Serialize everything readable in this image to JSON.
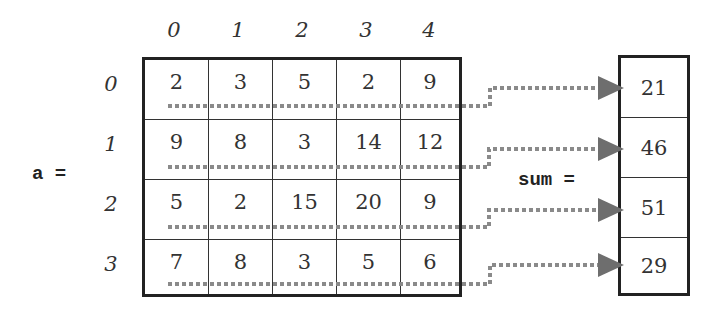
{
  "matrix": {
    "label": "a =",
    "col_indices": [
      "0",
      "1",
      "2",
      "3",
      "4"
    ],
    "row_indices": [
      "0",
      "1",
      "2",
      "3"
    ],
    "rows": [
      [
        "2",
        "3",
        "5",
        "2",
        "9"
      ],
      [
        "9",
        "8",
        "3",
        "14",
        "12"
      ],
      [
        "5",
        "2",
        "15",
        "20",
        "9"
      ],
      [
        "7",
        "8",
        "3",
        "5",
        "6"
      ]
    ]
  },
  "sum": {
    "label": "sum =",
    "values": [
      "21",
      "46",
      "51",
      "29"
    ]
  },
  "colors": {
    "border": "#222222",
    "connector": "#8a8a8a",
    "arrowhead": "#6e6e6e",
    "text": "#333333"
  }
}
